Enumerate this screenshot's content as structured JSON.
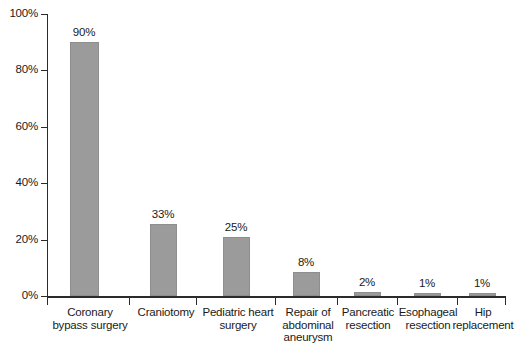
{
  "chart_data": {
    "type": "bar",
    "title": "",
    "xlabel": "",
    "ylabel": "",
    "ylim": [
      0,
      100
    ],
    "y_tick_labels": [
      "0%",
      "20%",
      "40%",
      "60%",
      "80%",
      "100%"
    ],
    "y_tick_values": [
      0,
      20,
      40,
      60,
      80,
      100
    ],
    "grid": false,
    "legend": "none",
    "value_suffix": "%",
    "categories": [
      "Coronary\nbypass surgery",
      "Craniotomy",
      "Pediatric heart\nsurgery",
      "Repair of\nabdominal\naneurysm",
      "Pancreatic\nresection",
      "Esophageal\nresection",
      "Hip\nreplacement"
    ],
    "values": [
      90,
      33,
      25,
      8,
      2,
      1,
      1
    ],
    "data_labels": [
      "90%",
      "33%",
      "25%",
      "8%",
      "2%",
      "1%",
      "1%"
    ],
    "drawn_heights_pct": [
      90,
      25.5,
      21,
      8.5,
      1.5,
      1,
      1
    ],
    "bar_color": "#9b9b9b",
    "bar_border_color": "#8e8e8e",
    "axis_color": "#2b2b2b",
    "background_color": "#ffffff",
    "bar_slots": [
      {
        "center": 84,
        "width": 29
      },
      {
        "center": 163,
        "width": 27
      },
      {
        "center": 236,
        "width": 27
      },
      {
        "center": 306,
        "width": 27
      },
      {
        "center": 367,
        "width": 27
      },
      {
        "center": 427,
        "width": 27
      },
      {
        "center": 482,
        "width": 27
      }
    ],
    "x_tick_positions": [
      47,
      129,
      196,
      275,
      337,
      397,
      457,
      505
    ],
    "label_slots": [
      {
        "center": 90,
        "width": 120
      },
      {
        "center": 166,
        "width": 78
      },
      {
        "center": 238,
        "width": 96
      },
      {
        "center": 308,
        "width": 72
      },
      {
        "center": 368,
        "width": 72
      },
      {
        "center": 428,
        "width": 72
      },
      {
        "center": 483,
        "width": 80
      }
    ]
  }
}
